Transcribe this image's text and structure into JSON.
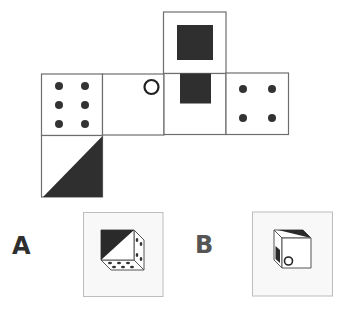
{
  "puzzle": {
    "type": "cube-net-folding",
    "colors": {
      "line": "#6e6e6e",
      "fill_dark": "#2f2f2f",
      "dot": "#333333",
      "background": "#ffffff",
      "option_box_border": "#bdbdbd",
      "option_box_fill": "#f8f8f8"
    },
    "net": {
      "faces": [
        {
          "id": "top-flap",
          "position": "above column 3",
          "pattern": "black-square"
        },
        {
          "id": "face-1",
          "position": "row 1 column 1",
          "pattern": "six-dots"
        },
        {
          "id": "face-2",
          "position": "row 1 column 2",
          "pattern": "small-circle-top-right"
        },
        {
          "id": "face-3",
          "position": "row 1 column 3",
          "pattern": "black-rectangle-top"
        },
        {
          "id": "face-4",
          "position": "row 1 column 4",
          "pattern": "four-dots"
        },
        {
          "id": "bottom-flap",
          "position": "below column 1",
          "pattern": "black-triangle-lower-right"
        }
      ]
    },
    "options": [
      {
        "label": "A",
        "visible_faces": {
          "front": "black-triangle-upper-left",
          "right": "four-dots",
          "bottom": "six-dots"
        }
      },
      {
        "label": "B",
        "visible_faces": {
          "front": "small-circle-bottom-left",
          "left": "black-rectangle",
          "top": "black-triangle"
        }
      }
    ]
  }
}
